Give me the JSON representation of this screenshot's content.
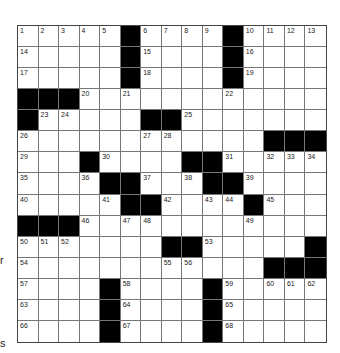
{
  "puzzle": {
    "rows": 15,
    "cols": 15,
    "grid": [
      "1,2,3,4,5,#,6,7,8,9,#,10,11,12,13",
      "14,.,.,.,.,#,15,.,.,.,#,16,.,.,.",
      "17,.,.,.,.,#,18,.,.,.,#,19,.,.,.",
      "#,#,#,20,.,21,.,.,.,.,22,.,.,.,.",
      "#,23,24,.,.,.,#,#,25,.,.,.,.,.,.",
      "26,.,.,.,.,.,27,28,.,.,.,.,#,#,#",
      "29,.,.,#,30,.,.,.,#,#,31,.,32,33,34",
      "35,.,.,36,#,#,37,.,38,#,#,39,.,.,.",
      "40,.,.,.,41,#,#,42,.,43,44,#,45,.,.",
      "#,#,#,46,.,47,48,.,.,.,.,49,.,.,.",
      "50,51,52,.,.,.,.,#,#,53,.,.,.,.,#",
      "54,.,.,.,.,.,.,55,56,.,.,.,#,#,#",
      "57,.,.,.,#,58,.,.,.,#,59,.,60,61,62",
      "63,.,.,.,#,64,.,.,.,#,65,.,.,.,.",
      "66,.,.,.,#,67,.,.,.,#,68,.,.,.,."
    ]
  },
  "left_fragments": [
    {
      "text": "r",
      "top": 254
    },
    {
      "text": "s",
      "top": 337
    }
  ]
}
